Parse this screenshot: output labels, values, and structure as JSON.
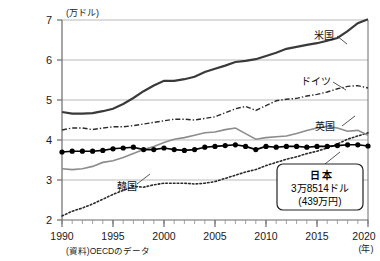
{
  "title": "",
  "source_note": "(資料)OECDのデータ",
  "axes": {
    "y_unit_label": "(万ドル)",
    "x_unit_label": "(年)",
    "y_ticks": [
      "2",
      "3",
      "4",
      "5",
      "6",
      "7"
    ],
    "x_ticks": [
      "1990",
      "1995",
      "2000",
      "2005",
      "2010",
      "2015",
      "2020"
    ]
  },
  "callout": {
    "country": "日本",
    "value_usd": "3万8514ドル",
    "value_jpy": "(439万円)"
  },
  "series_labels": {
    "us": "米国",
    "germany": "ドイツ",
    "uk": "英国",
    "japan": "日本",
    "korea": "韓国"
  },
  "colors": {
    "us": "#3a3a3a",
    "germany": "#2b2b2b",
    "uk": "#8c8c8c",
    "japan": "#000000",
    "korea": "#2b2b2b",
    "grid": "#b9b9b9",
    "axis": "#6b6b6b"
  },
  "chart_data": {
    "type": "line",
    "title": "",
    "xlabel": "(年)",
    "ylabel": "(万ドル)",
    "xlim": [
      1990,
      2020
    ],
    "ylim": [
      2,
      7
    ],
    "grid": true,
    "legend": "inline-annotations",
    "x": [
      1990,
      1991,
      1992,
      1993,
      1994,
      1995,
      1996,
      1997,
      1998,
      1999,
      2000,
      2001,
      2002,
      2003,
      2004,
      2005,
      2006,
      2007,
      2008,
      2009,
      2010,
      2011,
      2012,
      2013,
      2014,
      2015,
      2016,
      2017,
      2018,
      2019,
      2020
    ],
    "series": [
      {
        "name": "米国",
        "style": "solid-dark",
        "values": [
          4.7,
          4.66,
          4.66,
          4.67,
          4.72,
          4.78,
          4.9,
          5.05,
          5.22,
          5.36,
          5.48,
          5.48,
          5.52,
          5.58,
          5.7,
          5.78,
          5.86,
          5.95,
          5.98,
          6.02,
          6.1,
          6.18,
          6.28,
          6.33,
          6.38,
          6.42,
          6.48,
          6.55,
          6.72,
          6.92,
          7.02
        ]
      },
      {
        "name": "ドイツ",
        "style": "dash-dot",
        "values": [
          4.25,
          4.3,
          4.3,
          4.26,
          4.3,
          4.33,
          4.33,
          4.36,
          4.4,
          4.44,
          4.48,
          4.52,
          4.52,
          4.5,
          4.54,
          4.58,
          4.68,
          4.78,
          4.84,
          4.74,
          4.86,
          4.98,
          5.02,
          5.04,
          5.1,
          5.14,
          5.2,
          5.28,
          5.34,
          5.36,
          5.3
        ]
      },
      {
        "name": "英国",
        "style": "solid-gray",
        "values": [
          3.28,
          3.26,
          3.28,
          3.34,
          3.44,
          3.48,
          3.56,
          3.66,
          3.76,
          3.84,
          3.94,
          4.02,
          4.06,
          4.12,
          4.18,
          4.2,
          4.26,
          4.3,
          4.16,
          4.02,
          4.06,
          4.08,
          4.1,
          4.16,
          4.24,
          4.3,
          4.34,
          4.3,
          4.22,
          4.24,
          4.12
        ]
      },
      {
        "name": "日本",
        "style": "solid-marker",
        "values": [
          3.7,
          3.72,
          3.72,
          3.72,
          3.74,
          3.78,
          3.8,
          3.82,
          3.76,
          3.76,
          3.8,
          3.76,
          3.74,
          3.76,
          3.82,
          3.84,
          3.86,
          3.88,
          3.84,
          3.76,
          3.84,
          3.82,
          3.84,
          3.84,
          3.82,
          3.84,
          3.84,
          3.86,
          3.88,
          3.88,
          3.85
        ]
      },
      {
        "name": "韓国",
        "style": "dotted",
        "values": [
          2.1,
          2.22,
          2.3,
          2.4,
          2.52,
          2.64,
          2.74,
          2.84,
          2.82,
          2.88,
          2.92,
          2.92,
          2.92,
          2.9,
          2.92,
          2.96,
          3.04,
          3.12,
          3.2,
          3.26,
          3.36,
          3.44,
          3.52,
          3.58,
          3.66,
          3.72,
          3.8,
          3.9,
          4.02,
          4.1,
          4.18
        ]
      }
    ]
  }
}
